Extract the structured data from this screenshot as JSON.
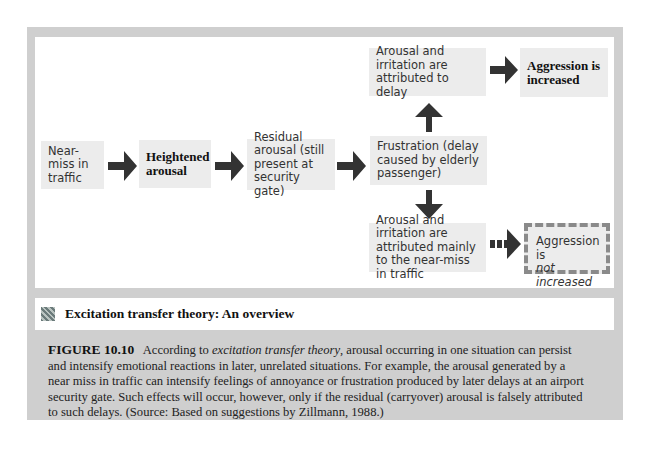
{
  "diagram": {
    "boxes": {
      "near_miss": "Near-miss in traffic",
      "heightened": "Heightened arousal",
      "residual": "Residual arousal (still present at security gate)",
      "frustration": "Frustration (delay caused by elderly passenger)",
      "attr_delay": "Arousal and irritation are attributed to delay",
      "aggr_increased": "Aggression is increased",
      "attr_nearmiss": "Arousal and irritation are attributed mainly to the near-miss in traffic",
      "aggr_not_1": "Aggression is",
      "aggr_not_2": "not increased"
    },
    "colors": {
      "box_fill": "#ececec",
      "arrow": "#333333",
      "frame": "#cfcfcf",
      "dashed_border": "#8a8a8a"
    }
  },
  "title_band": {
    "icon": "figure-thumbnail-icon",
    "title": "Excitation transfer theory: An overview"
  },
  "caption": {
    "label": "FIGURE 10.10",
    "part1": "According to ",
    "italic": "excitation transfer theory",
    "part2": ", arousal occurring in one situation can persist and intensify emotional reactions in later, unrelated situations. For example, the arousal generated by a near miss in traffic can intensify feelings of annoyance or frustration produced by later delays at an airport security gate. Such effects will occur, however, only if the residual (carryover) arousal is falsely attributed to such delays.  (Source: Based on suggestions by Zillmann, 1988.)"
  }
}
